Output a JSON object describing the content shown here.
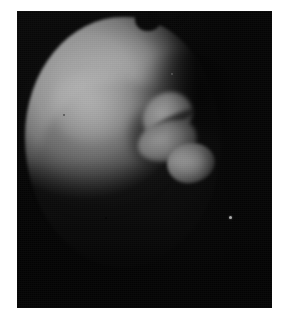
{
  "page": {
    "background_color": "#ffffff",
    "width": 285,
    "height": 326
  },
  "figure": {
    "name": "specimen-photograph",
    "media_type": "halftone black-and-white photograph",
    "plate": {
      "x": 17,
      "y": 11,
      "width": 255,
      "height": 297,
      "background_color": "#080808",
      "border": "none"
    },
    "caption": "",
    "label": "",
    "subject": {
      "description": "Bright rounded specimen illuminated from the upper left against a black background",
      "body_color_highlight": "#eeeeee",
      "body_color_midtone": "#a8a8a8",
      "body_color_shadow": "#141414",
      "background_color": "#060606"
    },
    "features": [
      {
        "name": "spherical-body",
        "description": "Large bright globular mass occupying the left and upper portion of the frame"
      },
      {
        "name": "rim-notch",
        "description": "Dark notch indenting the upper rim of the sphere"
      },
      {
        "name": "lobed-appendage",
        "description": "Bright multi-lobed protrusion extending from the right flank toward the lower right"
      },
      {
        "name": "flank-crease",
        "description": "Dark crease separating the body from the appendage"
      },
      {
        "name": "lower-falloff",
        "description": "Gradual tonal falloff into shadow across the lower half"
      },
      {
        "name": "bright-speck",
        "description": "Small white speck artefact in the dark field to the lower right"
      }
    ]
  }
}
